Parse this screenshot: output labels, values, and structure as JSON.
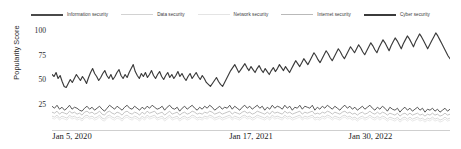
{
  "chart_data": {
    "type": "line",
    "title": "",
    "xlabel": "",
    "ylabel": "Popularity Score",
    "ylim": [
      0,
      105
    ],
    "yticks": [
      25,
      50,
      75,
      100
    ],
    "grid": false,
    "legend_position": "top",
    "xtick_labels": [
      "Jan 5, 2020",
      "Jan 17, 2021",
      "Jan 30, 2022"
    ],
    "xtick_positions": [
      0,
      0.5,
      1.0
    ],
    "series": [
      {
        "name": "Information security",
        "color": "#4a4a4a",
        "width": 0.9,
        "values": [
          24,
          22,
          25,
          21,
          23,
          20,
          22,
          25,
          21,
          23,
          22,
          20,
          19,
          22,
          24,
          21,
          23,
          20,
          22,
          24,
          21,
          19,
          22,
          25,
          23,
          21,
          24,
          22,
          20,
          23,
          25,
          22,
          21,
          24,
          22,
          20,
          23,
          21,
          24,
          22,
          25,
          23,
          21,
          22,
          24,
          20,
          23,
          25,
          22,
          21,
          23,
          19,
          22,
          24,
          21,
          23,
          25,
          22,
          20,
          23,
          21,
          24,
          22,
          25,
          23,
          20,
          22,
          24,
          21,
          23,
          22,
          25,
          21,
          24,
          22,
          20,
          23,
          25,
          22,
          24,
          21,
          23,
          25,
          22,
          24,
          20,
          23,
          21,
          25,
          22,
          24,
          23,
          21,
          25,
          22,
          24,
          20,
          23,
          22,
          25,
          21,
          24,
          23,
          22,
          25,
          20,
          23,
          21,
          24,
          22,
          25,
          23,
          21,
          24,
          22,
          20,
          23,
          25,
          22,
          24,
          21,
          23,
          20,
          22,
          24,
          21,
          23,
          25,
          22,
          20,
          23,
          21,
          24,
          22,
          19,
          23,
          21,
          20,
          22,
          18,
          21,
          23,
          20,
          22,
          19,
          21,
          23,
          20,
          22,
          18,
          21,
          20,
          22,
          19,
          21,
          18,
          20,
          22,
          19,
          21
        ]
      },
      {
        "name": "Data security",
        "color": "#d2d2d2",
        "width": 0.85,
        "values": [
          14,
          13,
          15,
          12,
          14,
          13,
          12,
          15,
          13,
          14,
          12,
          13,
          11,
          14,
          15,
          13,
          14,
          12,
          13,
          15,
          12,
          11,
          14,
          15,
          13,
          12,
          14,
          13,
          11,
          14,
          15,
          13,
          12,
          14,
          13,
          11,
          14,
          12,
          15,
          13,
          14,
          15,
          12,
          13,
          14,
          11,
          13,
          15,
          12,
          13,
          14,
          11,
          13,
          14,
          12,
          13,
          15,
          14,
          12,
          13,
          12,
          14,
          13,
          15,
          14,
          12,
          13,
          14,
          12,
          13,
          14,
          15,
          12,
          14,
          13,
          12,
          14,
          15,
          13,
          14,
          12,
          13,
          15,
          14,
          13,
          12,
          14,
          12,
          15,
          13,
          14,
          13,
          12,
          15,
          13,
          14,
          12,
          13,
          14,
          15,
          12,
          14,
          13,
          14,
          15,
          12,
          13,
          12,
          14,
          13,
          15,
          14,
          12,
          14,
          13,
          12,
          14,
          15,
          13,
          14,
          12,
          13,
          11,
          13,
          14,
          12,
          13,
          15,
          13,
          12,
          14,
          12,
          14,
          13,
          11,
          13,
          12,
          11,
          13,
          10,
          12,
          13,
          11,
          13,
          11,
          12,
          13,
          11,
          12,
          10,
          12,
          11,
          13,
          11,
          12,
          10,
          11,
          13,
          11,
          12
        ]
      },
      {
        "name": "Network security",
        "color": "#e4e4e4",
        "width": 0.85,
        "values": [
          12,
          11,
          13,
          10,
          12,
          11,
          10,
          13,
          11,
          12,
          10,
          11,
          9,
          12,
          13,
          11,
          12,
          10,
          11,
          13,
          10,
          9,
          12,
          13,
          11,
          10,
          12,
          11,
          9,
          12,
          13,
          11,
          10,
          12,
          11,
          9,
          12,
          10,
          13,
          11,
          12,
          13,
          10,
          11,
          12,
          9,
          11,
          13,
          10,
          11,
          12,
          9,
          11,
          12,
          10,
          11,
          13,
          12,
          10,
          11,
          10,
          12,
          11,
          13,
          12,
          10,
          11,
          12,
          10,
          11,
          12,
          13,
          10,
          12,
          11,
          10,
          12,
          13,
          11,
          12,
          10,
          11,
          13,
          12,
          11,
          10,
          12,
          10,
          13,
          11,
          12,
          11,
          10,
          13,
          11,
          12,
          10,
          11,
          12,
          13,
          10,
          12,
          11,
          12,
          13,
          10,
          11,
          10,
          12,
          11,
          13,
          12,
          10,
          12,
          11,
          10,
          12,
          13,
          11,
          12,
          10,
          11,
          9,
          11,
          12,
          10,
          11,
          13,
          11,
          10,
          12,
          10,
          12,
          11,
          9,
          11,
          10,
          9,
          11,
          8,
          10,
          11,
          9,
          11,
          9,
          10,
          11,
          9,
          10,
          8,
          10,
          9,
          11,
          9,
          10,
          8,
          9,
          11,
          9,
          10
        ]
      },
      {
        "name": "Internet security",
        "color": "#b9b9b9",
        "width": 0.85,
        "values": [
          18,
          17,
          19,
          16,
          18,
          17,
          16,
          19,
          17,
          18,
          16,
          17,
          15,
          18,
          19,
          17,
          18,
          16,
          17,
          19,
          16,
          15,
          18,
          19,
          17,
          16,
          18,
          17,
          15,
          18,
          19,
          17,
          16,
          18,
          17,
          15,
          18,
          16,
          19,
          17,
          18,
          19,
          16,
          17,
          18,
          15,
          17,
          19,
          16,
          17,
          18,
          15,
          17,
          18,
          16,
          17,
          19,
          18,
          16,
          17,
          16,
          18,
          17,
          19,
          18,
          16,
          17,
          18,
          16,
          17,
          18,
          19,
          16,
          18,
          17,
          16,
          18,
          19,
          17,
          18,
          16,
          17,
          19,
          18,
          17,
          16,
          18,
          16,
          19,
          17,
          18,
          17,
          16,
          19,
          17,
          18,
          16,
          17,
          18,
          19,
          16,
          18,
          17,
          18,
          19,
          16,
          17,
          16,
          18,
          17,
          19,
          18,
          16,
          18,
          17,
          16,
          18,
          19,
          17,
          18,
          16,
          17,
          15,
          17,
          18,
          16,
          17,
          19,
          17,
          16,
          18,
          16,
          18,
          17,
          15,
          17,
          16,
          15,
          17,
          14,
          16,
          17,
          15,
          17,
          15,
          16,
          17,
          15,
          16,
          14,
          16,
          15,
          17,
          15,
          16,
          14,
          15,
          17,
          15,
          16
        ]
      },
      {
        "name": "Cyber security",
        "color": "#3b3b3b",
        "width": 1.15,
        "values": [
          56,
          54,
          58,
          52,
          55,
          49,
          44,
          43,
          47,
          51,
          48,
          52,
          56,
          53,
          50,
          54,
          51,
          47,
          53,
          58,
          62,
          57,
          54,
          50,
          53,
          57,
          60,
          55,
          52,
          56,
          51,
          54,
          58,
          61,
          55,
          52,
          56,
          53,
          58,
          62,
          66,
          59,
          55,
          52,
          57,
          54,
          58,
          53,
          56,
          60,
          55,
          52,
          56,
          59,
          54,
          51,
          55,
          58,
          53,
          56,
          52,
          55,
          59,
          54,
          57,
          53,
          50,
          54,
          57,
          52,
          55,
          58,
          54,
          51,
          55,
          52,
          48,
          46,
          44,
          47,
          50,
          53,
          49,
          46,
          44,
          48,
          52,
          56,
          60,
          63,
          66,
          62,
          58,
          61,
          64,
          67,
          63,
          60,
          64,
          61,
          58,
          62,
          65,
          61,
          58,
          62,
          59,
          56,
          60,
          63,
          59,
          62,
          66,
          63,
          60,
          64,
          61,
          58,
          62,
          66,
          70,
          67,
          64,
          68,
          72,
          69,
          66,
          70,
          74,
          78,
          75,
          71,
          68,
          72,
          76,
          80,
          77,
          73,
          70,
          74,
          78,
          82,
          79,
          75,
          72,
          76,
          80,
          84,
          81,
          78,
          82,
          86,
          83,
          79,
          76,
          80,
          84,
          88,
          85,
          81,
          78,
          83,
          87,
          91,
          88,
          84,
          80,
          85,
          89,
          93,
          90,
          86,
          82,
          87,
          91,
          95,
          92,
          88,
          84,
          89,
          93,
          97,
          94,
          90,
          86,
          82,
          86,
          90,
          94,
          98,
          95,
          91,
          87,
          83,
          79,
          75,
          72
        ]
      }
    ]
  },
  "legend": {
    "items": [
      {
        "label": "Information security"
      },
      {
        "label": "Data security"
      },
      {
        "label": "Network security"
      },
      {
        "label": "Internet security"
      },
      {
        "label": "Cyber security"
      }
    ]
  },
  "axes": {
    "y_label": "Popularity Score",
    "y_ticks": [
      "100",
      "75",
      "50",
      "25"
    ],
    "x_ticks": [
      "Jan 5, 2020",
      "Jan 17, 2021",
      "Jan 30, 2022"
    ]
  }
}
